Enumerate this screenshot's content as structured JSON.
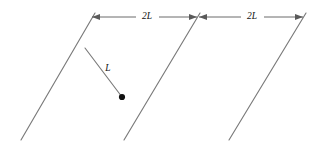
{
  "figure": {
    "background_color": "#ffffff",
    "width": 322,
    "height": 150,
    "line_color": "#7a7a7a",
    "dimension_color": "#5a5a5a",
    "label_color": "#111111",
    "bob_color": "#111111"
  },
  "labels": {
    "spacing_left": "2L",
    "spacing_right": "2L",
    "rod_length": "L"
  },
  "walls": [
    {
      "name": "wall-left",
      "x1": 95,
      "y1": 13,
      "x2": 21,
      "y2": 140
    },
    {
      "name": "wall-middle",
      "x1": 200,
      "y1": 13,
      "x2": 124,
      "y2": 140
    },
    {
      "name": "wall-right",
      "x1": 306,
      "y1": 13,
      "x2": 229,
      "y2": 140
    }
  ],
  "dimensions": [
    {
      "name": "dimension-2l-left",
      "label": "2L",
      "y": 17,
      "x_start": 92,
      "x_end": 197,
      "label_x": 147,
      "label_y": 16
    },
    {
      "name": "dimension-2l-right",
      "label": "2L",
      "y": 17,
      "x_start": 199,
      "x_end": 303,
      "label_x": 252,
      "label_y": 16
    }
  ],
  "pendulum": {
    "name": "pendulum",
    "pivot_x": 85,
    "pivot_y": 48,
    "bob_x": 122,
    "bob_y": 97,
    "bob_radius": 3.1,
    "label": "L",
    "label_x": 108,
    "label_y": 69
  }
}
